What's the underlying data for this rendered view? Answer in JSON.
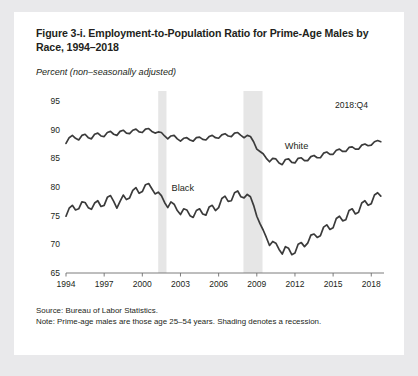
{
  "figure": {
    "title": "Figure 3-i. Employment-to-Population Ratio for Prime-Age Males by Race, 1994–2018",
    "units_label": "Percent (non–seasonally adjusted)",
    "end_annotation": "2018:Q4",
    "source_line": "Source: Bureau of Labor Statistics.",
    "note_line": "Note: Prime-age males are those age 25–54 years. Shading denotes a recession."
  },
  "chart_data": {
    "type": "line",
    "title": "Figure 3-i. Employment-to-Population Ratio for Prime-Age Males by Race, 1994–2018",
    "xlabel": "",
    "ylabel": "Percent (non–seasonally adjusted)",
    "xlim": [
      1994,
      2019
    ],
    "ylim": [
      65,
      95
    ],
    "ytick_values": [
      65,
      70,
      75,
      80,
      85,
      90,
      95
    ],
    "xtick_values": [
      1994,
      1997,
      2000,
      2003,
      2006,
      2009,
      2012,
      2015,
      2018
    ],
    "grid": false,
    "legend_position": "inline-labels",
    "line_color": "#3b3b3b",
    "shading_color": "#e6e6e6",
    "recessions": [
      {
        "label": "2001 recession",
        "start": 2001.25,
        "end": 2001.9
      },
      {
        "label": "Great Recession",
        "start": 2007.95,
        "end": 2009.45
      }
    ],
    "series": [
      {
        "name": "White",
        "label_x": 2011.2,
        "label_y": 86.9,
        "x": [
          1994,
          1994.25,
          1994.5,
          1994.75,
          1995,
          1995.25,
          1995.5,
          1995.75,
          1996,
          1996.25,
          1996.5,
          1996.75,
          1997,
          1997.25,
          1997.5,
          1997.75,
          1998,
          1998.25,
          1998.5,
          1998.75,
          1999,
          1999.25,
          1999.5,
          1999.75,
          2000,
          2000.25,
          2000.5,
          2000.75,
          2001,
          2001.25,
          2001.5,
          2001.75,
          2002,
          2002.25,
          2002.5,
          2002.75,
          2003,
          2003.25,
          2003.5,
          2003.75,
          2004,
          2004.25,
          2004.5,
          2004.75,
          2005,
          2005.25,
          2005.5,
          2005.75,
          2006,
          2006.25,
          2006.5,
          2006.75,
          2007,
          2007.25,
          2007.5,
          2007.75,
          2008,
          2008.25,
          2008.5,
          2008.75,
          2009,
          2009.25,
          2009.5,
          2009.75,
          2010,
          2010.25,
          2010.5,
          2010.75,
          2011,
          2011.25,
          2011.5,
          2011.75,
          2012,
          2012.25,
          2012.5,
          2012.75,
          2013,
          2013.25,
          2013.5,
          2013.75,
          2014,
          2014.25,
          2014.5,
          2014.75,
          2015,
          2015.25,
          2015.5,
          2015.75,
          2016,
          2016.25,
          2016.5,
          2016.75,
          2017,
          2017.25,
          2017.5,
          2017.75,
          2018,
          2018.25,
          2018.5,
          2018.75
        ],
        "y": [
          87.6,
          88.6,
          89.0,
          88.5,
          88.2,
          89.0,
          89.2,
          88.6,
          88.4,
          89.2,
          89.4,
          88.9,
          88.8,
          89.5,
          89.7,
          89.2,
          89.0,
          89.7,
          89.9,
          89.4,
          89.3,
          89.9,
          90.1,
          89.6,
          89.5,
          90.1,
          90.2,
          89.7,
          89.4,
          89.6,
          89.5,
          88.9,
          88.4,
          88.9,
          89.0,
          88.4,
          88.0,
          88.5,
          88.6,
          88.2,
          88.0,
          88.6,
          88.7,
          88.3,
          88.2,
          88.8,
          89.0,
          88.6,
          88.5,
          89.1,
          89.3,
          88.9,
          88.8,
          89.4,
          89.5,
          89.0,
          88.6,
          89.0,
          88.8,
          87.9,
          86.6,
          86.2,
          85.8,
          85.0,
          84.4,
          85.0,
          84.9,
          84.2,
          83.9,
          84.8,
          84.9,
          84.3,
          84.2,
          85.0,
          85.1,
          84.6,
          84.6,
          85.3,
          85.5,
          85.1,
          85.1,
          85.9,
          86.1,
          85.7,
          85.7,
          86.4,
          86.6,
          86.2,
          86.2,
          86.9,
          87.0,
          86.6,
          86.6,
          87.3,
          87.5,
          87.2,
          87.3,
          87.9,
          88.1,
          87.9
        ]
      },
      {
        "name": "Black",
        "label_x": 2002.3,
        "label_y": 79.6,
        "x": [
          1994,
          1994.25,
          1994.5,
          1994.75,
          1995,
          1995.25,
          1995.5,
          1995.75,
          1996,
          1996.25,
          1996.5,
          1996.75,
          1997,
          1997.25,
          1997.5,
          1997.75,
          1998,
          1998.25,
          1998.5,
          1998.75,
          1999,
          1999.25,
          1999.5,
          1999.75,
          2000,
          2000.25,
          2000.5,
          2000.75,
          2001,
          2001.25,
          2001.5,
          2001.75,
          2002,
          2002.25,
          2002.5,
          2002.75,
          2003,
          2003.25,
          2003.5,
          2003.75,
          2004,
          2004.25,
          2004.5,
          2004.75,
          2005,
          2005.25,
          2005.5,
          2005.75,
          2006,
          2006.25,
          2006.5,
          2006.75,
          2007,
          2007.25,
          2007.5,
          2007.75,
          2008,
          2008.25,
          2008.5,
          2008.75,
          2009,
          2009.25,
          2009.5,
          2009.75,
          2010,
          2010.25,
          2010.5,
          2010.75,
          2011,
          2011.25,
          2011.5,
          2011.75,
          2012,
          2012.25,
          2012.5,
          2012.75,
          2013,
          2013.25,
          2013.5,
          2013.75,
          2014,
          2014.25,
          2014.5,
          2014.75,
          2015,
          2015.25,
          2015.5,
          2015.75,
          2016,
          2016.25,
          2016.5,
          2016.75,
          2017,
          2017.25,
          2017.5,
          2017.75,
          2018,
          2018.25,
          2018.5,
          2018.75
        ],
        "y": [
          74.9,
          76.3,
          76.8,
          76.0,
          76.2,
          77.4,
          77.3,
          76.4,
          76.1,
          77.2,
          77.6,
          76.6,
          76.8,
          78.2,
          78.5,
          77.5,
          76.3,
          77.5,
          78.6,
          77.8,
          78.1,
          79.4,
          79.9,
          78.9,
          79.2,
          80.4,
          80.6,
          79.7,
          78.8,
          79.1,
          78.5,
          77.3,
          76.4,
          77.4,
          77.0,
          75.9,
          75.2,
          76.2,
          76.0,
          75.0,
          74.7,
          75.9,
          76.2,
          75.3,
          75.1,
          76.5,
          76.8,
          75.9,
          76.4,
          78.0,
          78.4,
          77.5,
          77.6,
          79.0,
          79.3,
          78.3,
          78.1,
          78.7,
          78.3,
          76.8,
          74.9,
          73.6,
          72.5,
          71.2,
          69.8,
          70.5,
          70.2,
          69.1,
          68.3,
          69.6,
          69.3,
          68.2,
          68.5,
          70.0,
          70.3,
          69.6,
          70.2,
          71.6,
          71.8,
          71.2,
          71.5,
          73.0,
          73.4,
          72.6,
          72.9,
          74.5,
          74.9,
          74.1,
          74.3,
          75.9,
          76.2,
          75.3,
          75.6,
          77.2,
          77.6,
          76.8,
          77.1,
          78.6,
          79.0,
          78.4
        ]
      }
    ]
  }
}
